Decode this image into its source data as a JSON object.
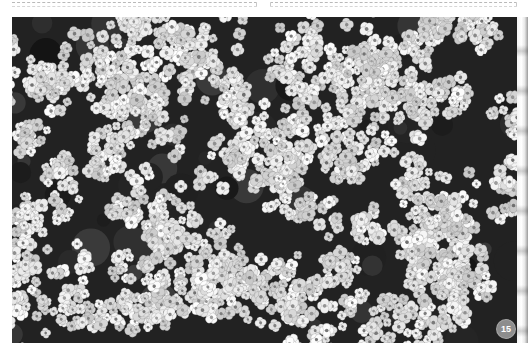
{
  "page": {
    "type": "book-page",
    "page_number": "15"
  },
  "header": {
    "left_box": "dashed-placeholder",
    "right_box": "dashed-placeholder"
  },
  "photo": {
    "subject": "Dense cluster of small white flowers (sweet alyssum)",
    "style": "grayscale",
    "alt": "Close-up of a carpet of tiny white four-petaled flowers"
  },
  "colors": {
    "background": "#ffffff",
    "flower_white": "#f2f2f2",
    "shadow_dark": "#1e1e1e",
    "badge": "#8d8d8d"
  }
}
